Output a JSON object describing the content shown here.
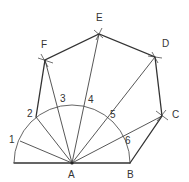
{
  "vertices": {
    "A": {
      "label": "A",
      "x": 72,
      "y": 163
    },
    "B": {
      "label": "B",
      "x": 130,
      "y": 163
    },
    "C": {
      "label": "C",
      "x": 162,
      "y": 116
    },
    "D": {
      "label": "D",
      "x": 155,
      "y": 57
    },
    "E": {
      "label": "E",
      "x": 99,
      "y": 34
    },
    "F": {
      "label": "F",
      "x": 45,
      "y": 60
    }
  },
  "arc_divisions": [
    {
      "label": "1",
      "x": 20,
      "y": 141
    },
    {
      "label": "2",
      "x": 36,
      "y": 117
    },
    {
      "label": "3",
      "x": 59,
      "y": 106
    },
    {
      "label": "4",
      "x": 88,
      "y": 106
    },
    {
      "label": "5",
      "x": 110,
      "y": 120
    },
    {
      "label": "6",
      "x": 126,
      "y": 138
    }
  ],
  "semicircle": {
    "center": "A",
    "radius": 58
  },
  "colors": {
    "line": "#333333",
    "background": "#ffffff"
  }
}
